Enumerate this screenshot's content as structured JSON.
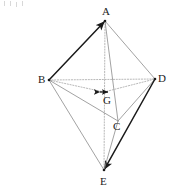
{
  "figure": {
    "type": "geometry-diagram",
    "canvas": {
      "width": 175,
      "height": 195,
      "background": "#ffffff"
    },
    "colors": {
      "dark_edge": "#1a1a1a",
      "solid_edge": "#8a8a8a",
      "dotted_edge": "#9a9a9a",
      "label_text": "#1c1c1c",
      "point_marker": "#1a1a1a"
    },
    "vertices": [
      {
        "id": "A",
        "label": "A",
        "x": 105,
        "y": 21,
        "label_x": 102,
        "label_y": 6,
        "marker": true
      },
      {
        "id": "B",
        "label": "B",
        "x": 49,
        "y": 80,
        "label_x": 38,
        "label_y": 74,
        "marker": true
      },
      {
        "id": "D",
        "label": "D",
        "x": 155,
        "y": 79,
        "label_x": 158,
        "label_y": 73,
        "marker": true
      },
      {
        "id": "C",
        "label": "C",
        "x": 118,
        "y": 121,
        "label_x": 113,
        "label_y": 121,
        "marker": false
      },
      {
        "id": "E",
        "label": "E",
        "x": 104,
        "y": 170,
        "label_x": 100,
        "label_y": 176,
        "marker": true
      },
      {
        "id": "G",
        "label": "G",
        "x": 104,
        "y": 92,
        "label_x": 103,
        "label_y": 95,
        "marker": true
      }
    ],
    "edges": [
      {
        "id": "BA",
        "from": "B",
        "to": "A",
        "style": "dark",
        "arrow": true,
        "label": "B to A"
      },
      {
        "id": "AD",
        "from": "A",
        "to": "D",
        "style": "solid",
        "arrow": false,
        "label": "A to D"
      },
      {
        "id": "AE",
        "from": "A",
        "to": "E",
        "style": "dotted",
        "arrow": false,
        "label": "A to E through G"
      },
      {
        "id": "AC",
        "from": "A",
        "to": "C",
        "style": "solid",
        "arrow": false,
        "label": "A to C"
      },
      {
        "id": "BD",
        "from": "B",
        "to": "D",
        "style": "dotted",
        "arrow": false,
        "label": "B to D"
      },
      {
        "id": "BC",
        "from": "B",
        "to": "C",
        "style": "solid",
        "arrow": false,
        "label": "B to C"
      },
      {
        "id": "CD",
        "from": "C",
        "to": "D",
        "style": "solid",
        "arrow": false,
        "label": "C to D"
      },
      {
        "id": "BE",
        "from": "B",
        "to": "E",
        "style": "solid",
        "arrow": false,
        "label": "B to E"
      },
      {
        "id": "DE",
        "from": "D",
        "to": "E",
        "style": "dark",
        "arrow": true,
        "label": "D to E"
      },
      {
        "id": "CE",
        "from": "C",
        "to": "E",
        "style": "solid",
        "arrow": false,
        "label": "C to E"
      },
      {
        "id": "GB",
        "from": "G",
        "to": "B",
        "style": "dotted",
        "arrow": false,
        "label": "G to B"
      },
      {
        "id": "GD",
        "from": "G",
        "to": "D",
        "style": "dotted",
        "arrow": false,
        "label": "G to D"
      }
    ],
    "specks": [
      {
        "x": 4,
        "y": 1
      },
      {
        "x": 10,
        "y": 1
      },
      {
        "x": 16,
        "y": 2
      },
      {
        "x": 22,
        "y": 1
      }
    ]
  }
}
